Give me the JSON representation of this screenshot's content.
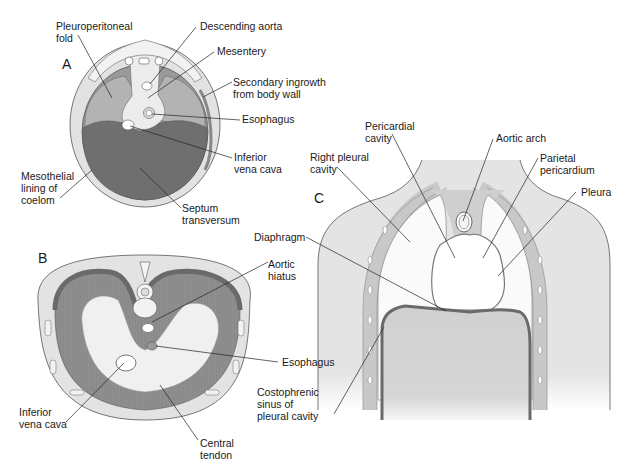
{
  "figure": {
    "panels": [
      {
        "id": "A",
        "letter": "A",
        "labels": {
          "pleuroperitoneal_fold": "Pleuroperitoneal\nfold",
          "descending_aorta": "Descending aorta",
          "mesentery": "Mesentery",
          "secondary_ingrowth": "Secondary ingrowth\nfrom body wall",
          "esophagus": "Esophagus",
          "inferior_vena_cava": "Inferior\nvena cava",
          "mesothelial_lining": "Mesothelial\nlining of\ncoelom",
          "septum_transversum": "Septum\ntransversum"
        }
      },
      {
        "id": "B",
        "letter": "B",
        "labels": {
          "aortic_hiatus": "Aortic\nhiatus",
          "esophagus": "Esophagus",
          "inferior_vena_cava": "Inferior\nvena cava",
          "central_tendon": "Central\ntendon"
        }
      },
      {
        "id": "C",
        "letter": "C",
        "labels": {
          "pericardial_cavity": "Pericardial\ncavity",
          "aortic_arch": "Aortic arch",
          "right_pleural_cavity": "Right pleural\ncavity",
          "parietal_pericardium": "Parietal\npericardium",
          "pleura": "Pleura",
          "diaphragm": "Diaphragm",
          "costophrenic_sinus": "Costophrenic\nsinus of\npleural cavity"
        }
      }
    ]
  },
  "colors": {
    "septum_dark": "#6e6e6e",
    "fold_mid": "#a9a9a9",
    "body_wall_light": "#dedede",
    "mesothelial": "#8a8a8a",
    "muscle_gray": "#8c8c8c",
    "tendon_light": "#efefef",
    "body_fill": "#e6e6e6",
    "abdomen_fill": "#d4d4d4",
    "line": "#222222"
  }
}
